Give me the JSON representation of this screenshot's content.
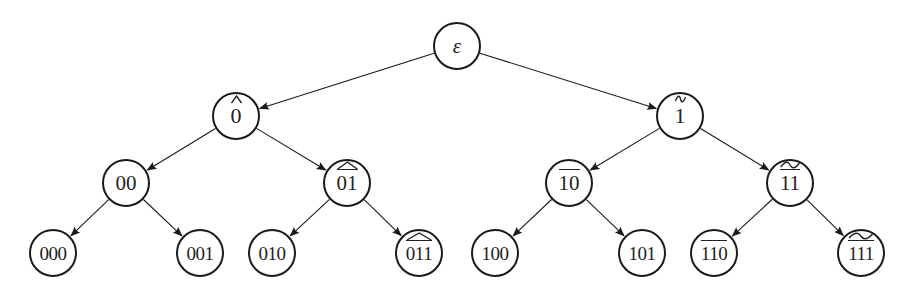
{
  "diagram": {
    "type": "binary-tree",
    "colors": {
      "stroke": "#1a1a1a",
      "text": "#222222",
      "background": "#ffffff"
    },
    "nodes": [
      {
        "id": "root",
        "text": "ε",
        "level": 0,
        "cx": 457,
        "cy": 46,
        "r": 24,
        "overline": false,
        "accent": "none"
      },
      {
        "id": "n0",
        "text": "0",
        "level": 1,
        "cx": 236,
        "cy": 116,
        "r": 24,
        "overline": false,
        "accent": "hat"
      },
      {
        "id": "n1",
        "text": "1",
        "level": 1,
        "cx": 680,
        "cy": 116,
        "r": 24,
        "overline": false,
        "accent": "tilde"
      },
      {
        "id": "n00",
        "text": "00",
        "level": 2,
        "cx": 126,
        "cy": 183,
        "r": 24,
        "overline": false,
        "accent": "none"
      },
      {
        "id": "n01",
        "text": "01",
        "level": 2,
        "cx": 347,
        "cy": 183,
        "r": 24,
        "overline": true,
        "accent": "hat"
      },
      {
        "id": "n10",
        "text": "10",
        "level": 2,
        "cx": 569,
        "cy": 183,
        "r": 24,
        "overline": true,
        "accent": "none"
      },
      {
        "id": "n11",
        "text": "11",
        "level": 2,
        "cx": 790,
        "cy": 183,
        "r": 24,
        "overline": true,
        "accent": "tilde"
      },
      {
        "id": "n000",
        "text": "000",
        "level": 3,
        "cx": 53,
        "cy": 253,
        "r": 24,
        "overline": false,
        "accent": "none"
      },
      {
        "id": "n001",
        "text": "001",
        "level": 3,
        "cx": 200,
        "cy": 253,
        "r": 24,
        "overline": false,
        "accent": "none"
      },
      {
        "id": "n010",
        "text": "010",
        "level": 3,
        "cx": 272,
        "cy": 253,
        "r": 24,
        "overline": false,
        "accent": "none"
      },
      {
        "id": "n011",
        "text": "011",
        "level": 3,
        "cx": 419,
        "cy": 253,
        "r": 24,
        "overline": true,
        "accent": "hat"
      },
      {
        "id": "n100",
        "text": "100",
        "level": 3,
        "cx": 495,
        "cy": 253,
        "r": 24,
        "overline": false,
        "accent": "none"
      },
      {
        "id": "n101",
        "text": "101",
        "level": 3,
        "cx": 642,
        "cy": 253,
        "r": 24,
        "overline": false,
        "accent": "none"
      },
      {
        "id": "n110",
        "text": "110",
        "level": 3,
        "cx": 714,
        "cy": 253,
        "r": 24,
        "overline": true,
        "accent": "none"
      },
      {
        "id": "n111",
        "text": "111",
        "level": 3,
        "cx": 861,
        "cy": 253,
        "r": 24,
        "overline": true,
        "accent": "tilde"
      }
    ],
    "edges": [
      {
        "from": "root",
        "to": "n0",
        "arrow": true
      },
      {
        "from": "root",
        "to": "n1",
        "arrow": true
      },
      {
        "from": "n0",
        "to": "n00",
        "arrow": true
      },
      {
        "from": "n0",
        "to": "n01",
        "arrow": true
      },
      {
        "from": "n1",
        "to": "n10",
        "arrow": true
      },
      {
        "from": "n1",
        "to": "n11",
        "arrow": true
      },
      {
        "from": "n00",
        "to": "n000",
        "arrow": true
      },
      {
        "from": "n00",
        "to": "n001",
        "arrow": true
      },
      {
        "from": "n01",
        "to": "n010",
        "arrow": true
      },
      {
        "from": "n01",
        "to": "n011",
        "arrow": true
      },
      {
        "from": "n10",
        "to": "n100",
        "arrow": true
      },
      {
        "from": "n10",
        "to": "n101",
        "arrow": true
      },
      {
        "from": "n11",
        "to": "n110",
        "arrow": true
      },
      {
        "from": "n11",
        "to": "n111",
        "arrow": true
      }
    ]
  }
}
